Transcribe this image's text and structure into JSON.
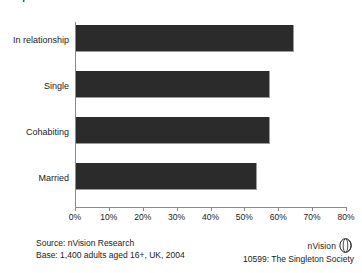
{
  "chart_data": {
    "type": "bar",
    "orientation": "horizontal",
    "title": "Proportion of Under 40s who eat alone",
    "categories": [
      "In relationship",
      "Single",
      "Cohabiting",
      "Married"
    ],
    "values": [
      64,
      57,
      57,
      53
    ],
    "xlabel": "",
    "ylabel": "",
    "xlim": [
      0,
      80
    ],
    "xticks": [
      0,
      10,
      20,
      30,
      40,
      50,
      60,
      70,
      80
    ],
    "xtick_labels": [
      "0%",
      "10%",
      "20%",
      "30%",
      "40%",
      "50%",
      "60%",
      "70%",
      "80%"
    ],
    "grid": false,
    "legend": "none",
    "bar_color": "#2b2b2b",
    "axis_color": "#8a8a8a"
  },
  "footer": {
    "source_line": "Source: nVision Research",
    "base_line": "Base: 1,400 adults aged 16+, UK, 2004",
    "logo_text": "nVision",
    "logo_icon": "sphere-icon",
    "report_id": "10599: The Singleton Society"
  }
}
